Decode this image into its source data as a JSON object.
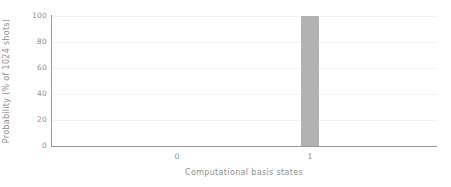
{
  "chart_data": {
    "type": "bar",
    "title": "",
    "categories": [
      "0",
      "1"
    ],
    "values": [
      0,
      100
    ],
    "series": [
      {
        "name": "counts",
        "values": [
          0,
          100
        ]
      }
    ],
    "xlabel": "Computational basis states",
    "ylabel": "Probability (% of 1024 shots)",
    "ylim": [
      0,
      100
    ],
    "yticks": [
      "100",
      "80",
      "60",
      "40",
      "20",
      "0"
    ],
    "ytick_values": [
      100,
      80,
      60,
      40,
      20,
      0
    ],
    "xticks": [
      "0",
      "1"
    ],
    "grid": true,
    "grid_axis": "y",
    "legend": "none",
    "bar_color": "#b2b2b2",
    "grid_color": "#f4f4f4",
    "axis_color": "#9a9a9a",
    "text_color": "#8f8f8f",
    "background": "#ffffff"
  }
}
